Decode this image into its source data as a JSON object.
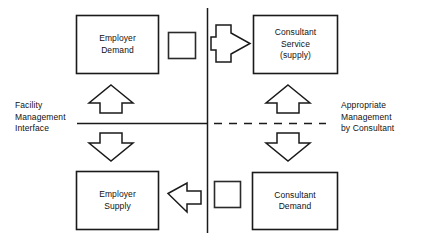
{
  "diagram": {
    "colors": {
      "stroke": "#1a1a1a",
      "fill": "#ffffff",
      "text": "#111111"
    },
    "boxes": [
      {
        "id": "employer-demand",
        "lines": "Employer\nDemand",
        "quadrant": "top-left"
      },
      {
        "id": "consultant-service-supply",
        "lines": "Consultant\nService\n(supply)",
        "quadrant": "top-right"
      },
      {
        "id": "employer-supply",
        "lines": "Employer\nSupply",
        "quadrant": "bottom-left"
      },
      {
        "id": "consultant-demand",
        "lines": "Consultant\nDemand",
        "quadrant": "bottom-right"
      }
    ],
    "side_labels": [
      {
        "id": "facility-management-interface",
        "text": "Facility\nManagement\nInterface",
        "side": "left"
      },
      {
        "id": "appropriate-management-by-consultant",
        "text": "Appropriate\nManagement\nby Consultant",
        "side": "right"
      }
    ],
    "arrows": [
      {
        "id": "arrow-employer-demand-to-consultant-service",
        "direction": "right"
      },
      {
        "id": "arrow-employer-supply-up-to-employer-demand",
        "direction": "up"
      },
      {
        "id": "arrow-consultant-demand-up-to-consultant-service",
        "direction": "up"
      },
      {
        "id": "arrow-employer-demand-down-to-employer-supply",
        "direction": "down"
      },
      {
        "id": "arrow-consultant-service-down-to-consultant-demand",
        "direction": "down"
      },
      {
        "id": "arrow-consultant-demand-to-employer-supply",
        "direction": "left"
      }
    ],
    "connectors": [
      {
        "id": "small-square-top",
        "shape": "square"
      },
      {
        "id": "small-square-bottom",
        "shape": "square"
      }
    ],
    "divider_lines": [
      {
        "id": "vertical-divider",
        "style": "solid",
        "orientation": "vertical"
      },
      {
        "id": "horizontal-interface-line",
        "style": "solid",
        "orientation": "horizontal"
      },
      {
        "id": "horizontal-dashed-line",
        "style": "dashed",
        "orientation": "horizontal"
      }
    ]
  }
}
